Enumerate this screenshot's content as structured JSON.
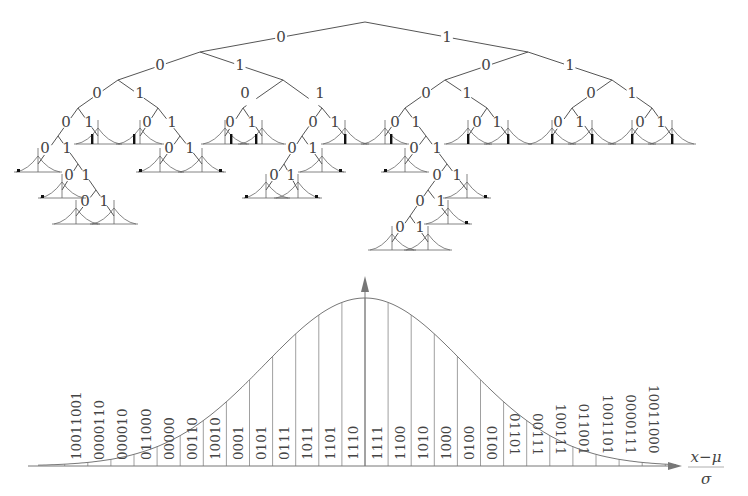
{
  "header_fragment": {
    "text": "y        y                                y"
  },
  "tree": {
    "title": "Binary code tree",
    "root": {
      "x": 365,
      "y": 22
    },
    "edge_labels": [
      {
        "label": "0",
        "x": 281,
        "y": 42,
        "from": [
          365,
          22
        ],
        "to": [
          200,
          52
        ]
      },
      {
        "label": "1",
        "x": 447,
        "y": 42,
        "from": [
          365,
          22
        ],
        "to": [
          528,
          52
        ]
      },
      {
        "label": "0",
        "x": 160,
        "y": 70,
        "from": [
          200,
          52
        ],
        "to": [
          118,
          80
        ]
      },
      {
        "label": "1",
        "x": 240,
        "y": 70,
        "from": [
          200,
          52
        ],
        "to": [
          283,
          80
        ]
      },
      {
        "label": "0",
        "x": 97,
        "y": 98,
        "from": [
          118,
          80
        ],
        "to": [
          78,
          108
        ]
      },
      {
        "label": "1",
        "x": 140,
        "y": 98,
        "from": [
          118,
          80
        ],
        "to": [
          158,
          108
        ]
      },
      {
        "label": "0",
        "x": 66,
        "y": 127,
        "from": [
          78,
          108
        ],
        "to": [
          58,
          136
        ]
      },
      {
        "label": "1",
        "x": 89,
        "y": 127,
        "from": [
          78,
          108
        ],
        "to": [
          98,
          136
        ]
      },
      {
        "label": "0",
        "x": 45,
        "y": 153,
        "from": [
          58,
          136
        ],
        "to": [
          38,
          164
        ]
      },
      {
        "label": "1",
        "x": 67,
        "y": 153,
        "from": [
          58,
          136
        ],
        "to": [
          78,
          164
        ]
      },
      {
        "label": "0",
        "x": 69,
        "y": 180,
        "from": [
          78,
          164
        ],
        "to": [
          62,
          190
        ]
      },
      {
        "label": "1",
        "x": 86,
        "y": 180,
        "from": [
          78,
          164
        ],
        "to": [
          96,
          190
        ]
      },
      {
        "label": "0",
        "x": 85,
        "y": 206,
        "from": [
          96,
          190
        ],
        "to": [
          76,
          216
        ]
      },
      {
        "label": "1",
        "x": 104,
        "y": 206,
        "from": [
          96,
          190
        ],
        "to": [
          114,
          216
        ]
      },
      {
        "label": "0",
        "x": 147,
        "y": 127,
        "from": [
          158,
          108
        ],
        "to": [
          140,
          136
        ]
      },
      {
        "label": "1",
        "x": 172,
        "y": 127,
        "from": [
          158,
          108
        ],
        "to": [
          180,
          136
        ]
      },
      {
        "label": "0",
        "x": 169,
        "y": 153,
        "from": [
          180,
          136
        ],
        "to": [
          160,
          164
        ]
      },
      {
        "label": "1",
        "x": 190,
        "y": 153,
        "from": [
          180,
          136
        ],
        "to": [
          202,
          164
        ]
      },
      {
        "label": "0",
        "x": 245,
        "y": 98,
        "from": [
          283,
          80
        ],
        "to": [
          243,
          108
        ]
      },
      {
        "label": "1",
        "x": 320,
        "y": 98,
        "from": [
          283,
          80
        ],
        "to": [
          322,
          108
        ]
      },
      {
        "label": "0",
        "x": 230,
        "y": 127,
        "from": [
          243,
          108
        ],
        "to": [
          225,
          136
        ]
      },
      {
        "label": "1",
        "x": 252,
        "y": 127,
        "from": [
          243,
          108
        ],
        "to": [
          262,
          136
        ]
      },
      {
        "label": "0",
        "x": 313,
        "y": 127,
        "from": [
          322,
          108
        ],
        "to": [
          302,
          136
        ]
      },
      {
        "label": "1",
        "x": 335,
        "y": 127,
        "from": [
          322,
          108
        ],
        "to": [
          345,
          136
        ]
      },
      {
        "label": "0",
        "x": 292,
        "y": 153,
        "from": [
          302,
          136
        ],
        "to": [
          284,
          164
        ]
      },
      {
        "label": "1",
        "x": 313,
        "y": 153,
        "from": [
          302,
          136
        ],
        "to": [
          322,
          164
        ]
      },
      {
        "label": "0",
        "x": 274,
        "y": 180,
        "from": [
          284,
          164
        ],
        "to": [
          266,
          190
        ]
      },
      {
        "label": "1",
        "x": 291,
        "y": 180,
        "from": [
          284,
          164
        ],
        "to": [
          298,
          190
        ]
      },
      {
        "label": "0",
        "x": 486,
        "y": 70,
        "from": [
          528,
          52
        ],
        "to": [
          445,
          80
        ]
      },
      {
        "label": "1",
        "x": 570,
        "y": 70,
        "from": [
          528,
          52
        ],
        "to": [
          612,
          80
        ]
      },
      {
        "label": "0",
        "x": 426,
        "y": 98,
        "from": [
          445,
          80
        ],
        "to": [
          405,
          108
        ]
      },
      {
        "label": "1",
        "x": 467,
        "y": 98,
        "from": [
          445,
          80
        ],
        "to": [
          487,
          108
        ]
      },
      {
        "label": "0",
        "x": 395,
        "y": 127,
        "from": [
          405,
          108
        ],
        "to": [
          385,
          136
        ]
      },
      {
        "label": "1",
        "x": 416,
        "y": 127,
        "from": [
          405,
          108
        ],
        "to": [
          426,
          136
        ]
      },
      {
        "label": "0",
        "x": 414,
        "y": 153,
        "from": [
          426,
          136
        ],
        "to": [
          405,
          164
        ]
      },
      {
        "label": "1",
        "x": 437,
        "y": 153,
        "from": [
          426,
          136
        ],
        "to": [
          447,
          164
        ]
      },
      {
        "label": "0",
        "x": 437,
        "y": 180,
        "from": [
          447,
          164
        ],
        "to": [
          428,
          190
        ]
      },
      {
        "label": "1",
        "x": 457,
        "y": 180,
        "from": [
          447,
          164
        ],
        "to": [
          467,
          190
        ]
      },
      {
        "label": "0",
        "x": 420,
        "y": 206,
        "from": [
          428,
          190
        ],
        "to": [
          410,
          216
        ]
      },
      {
        "label": "1",
        "x": 441,
        "y": 206,
        "from": [
          428,
          190
        ],
        "to": [
          448,
          216
        ]
      },
      {
        "label": "0",
        "x": 400,
        "y": 232,
        "from": [
          410,
          216
        ],
        "to": [
          392,
          242
        ]
      },
      {
        "label": "1",
        "x": 420,
        "y": 232,
        "from": [
          410,
          216
        ],
        "to": [
          428,
          242
        ]
      },
      {
        "label": "0",
        "x": 477,
        "y": 127,
        "from": [
          487,
          108
        ],
        "to": [
          468,
          136
        ]
      },
      {
        "label": "1",
        "x": 497,
        "y": 127,
        "from": [
          487,
          108
        ],
        "to": [
          508,
          136
        ]
      },
      {
        "label": "0",
        "x": 591,
        "y": 98,
        "from": [
          612,
          80
        ],
        "to": [
          572,
          108
        ]
      },
      {
        "label": "1",
        "x": 632,
        "y": 98,
        "from": [
          612,
          80
        ],
        "to": [
          652,
          108
        ]
      },
      {
        "label": "0",
        "x": 558,
        "y": 127,
        "from": [
          572,
          108
        ],
        "to": [
          552,
          136
        ]
      },
      {
        "label": "1",
        "x": 580,
        "y": 127,
        "from": [
          572,
          108
        ],
        "to": [
          592,
          136
        ]
      },
      {
        "label": "0",
        "x": 640,
        "y": 127,
        "from": [
          652,
          108
        ],
        "to": [
          632,
          136
        ]
      },
      {
        "label": "1",
        "x": 661,
        "y": 127,
        "from": [
          652,
          108
        ],
        "to": [
          672,
          136
        ]
      }
    ],
    "leaves": [
      {
        "x": 38,
        "y": 172,
        "mark": "left"
      },
      {
        "x": 62,
        "y": 198,
        "mark": "left"
      },
      {
        "x": 76,
        "y": 224,
        "mark": "none"
      },
      {
        "x": 114,
        "y": 224,
        "mark": "none"
      },
      {
        "x": 98,
        "y": 144,
        "mark": "left-mid"
      },
      {
        "x": 140,
        "y": 144,
        "mark": "left-mid"
      },
      {
        "x": 160,
        "y": 172,
        "mark": "left"
      },
      {
        "x": 202,
        "y": 172,
        "mark": "right"
      },
      {
        "x": 225,
        "y": 144,
        "mark": "right-mid"
      },
      {
        "x": 262,
        "y": 144,
        "mark": "left-mid"
      },
      {
        "x": 345,
        "y": 144,
        "mark": "center"
      },
      {
        "x": 322,
        "y": 172,
        "mark": "right"
      },
      {
        "x": 266,
        "y": 198,
        "mark": "left"
      },
      {
        "x": 298,
        "y": 198,
        "mark": "right"
      },
      {
        "x": 385,
        "y": 144,
        "mark": "right-mid"
      },
      {
        "x": 405,
        "y": 172,
        "mark": "left"
      },
      {
        "x": 467,
        "y": 198,
        "mark": "right"
      },
      {
        "x": 448,
        "y": 224,
        "mark": "right"
      },
      {
        "x": 392,
        "y": 250,
        "mark": "none"
      },
      {
        "x": 428,
        "y": 250,
        "mark": "none"
      },
      {
        "x": 468,
        "y": 144,
        "mark": "center"
      },
      {
        "x": 508,
        "y": 144,
        "mark": "center"
      },
      {
        "x": 552,
        "y": 144,
        "mark": "center"
      },
      {
        "x": 592,
        "y": 144,
        "mark": "center"
      },
      {
        "x": 632,
        "y": 144,
        "mark": "center"
      },
      {
        "x": 672,
        "y": 144,
        "mark": "center"
      }
    ]
  },
  "distribution": {
    "title": "Standard normal quantization bins",
    "x_axis_label_numerator": "x−μ",
    "x_axis_label_denominator": "σ",
    "baseline_y": 466,
    "x_start": 38,
    "x_end": 676,
    "peak_x": 365,
    "peak_y": 298,
    "bin_width": 23.1,
    "first_bin_x": 65,
    "left_codes": [
      "10011001",
      "0000110",
      "000010",
      "011000",
      "00000",
      "00110",
      "10010",
      "0001"
    ],
    "center_codes": [
      "0101",
      "0111",
      "1011",
      "1101",
      "1110",
      "1111",
      "1100",
      "1010",
      "1000",
      "0100",
      "0010"
    ],
    "right_codes": [
      "01101",
      "00111",
      "100111",
      "011001",
      "1001101",
      "0000111",
      "10011000"
    ]
  }
}
